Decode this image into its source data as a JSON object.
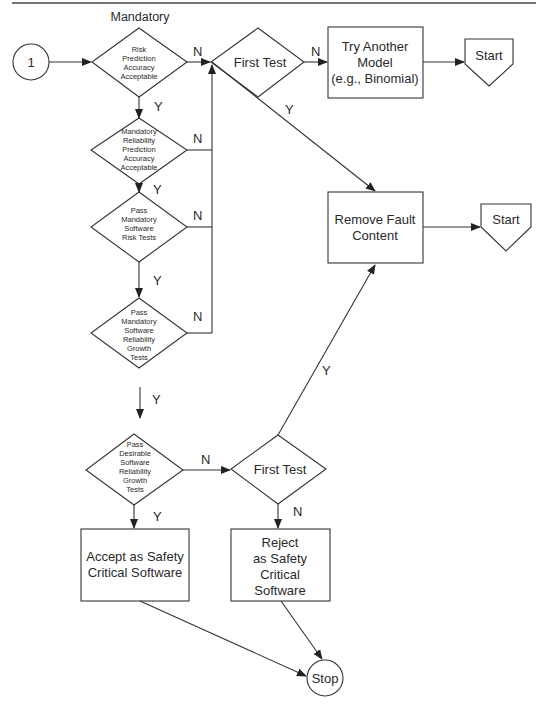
{
  "page": {
    "top_rule": true,
    "section_label": "Mandatory"
  },
  "nodes": {
    "connector_1": {
      "label": "1"
    },
    "risk_prediction": {
      "lines": [
        "Risk",
        "Prediction",
        "Accuracy",
        "Acceptable"
      ]
    },
    "first_test_top": {
      "label": "First Test"
    },
    "try_another_model": {
      "lines": [
        "Try Another",
        "Model",
        "(e.g., Binomial)"
      ]
    },
    "start_top": {
      "label": "Start"
    },
    "mandatory_reliability": {
      "lines": [
        "Mandatory",
        "Reliability",
        "Prediction",
        "Accuracy",
        "Acceptable"
      ]
    },
    "pass_mandatory_risk": {
      "lines": [
        "Pass",
        "Mandatory",
        "Software",
        "Risk Tests"
      ]
    },
    "remove_fault_content": {
      "lines": [
        "Remove Fault",
        "Content"
      ]
    },
    "start_mid": {
      "label": "Start"
    },
    "pass_mandatory_growth": {
      "lines": [
        "Pass",
        "Mandatory",
        "Software",
        "Reliability",
        "Growth",
        "Tests"
      ]
    },
    "pass_desirable_growth": {
      "lines": [
        "Pass",
        "Desirable",
        "Software",
        "Reliability",
        "Growth",
        "Tests"
      ]
    },
    "first_test_bottom": {
      "label": "First Test"
    },
    "accept": {
      "lines": [
        "Accept as Safety",
        "Critical Software"
      ]
    },
    "reject": {
      "lines": [
        "Reject",
        "as Safety",
        "Critical",
        "Software"
      ]
    },
    "stop": {
      "label": "Stop"
    }
  },
  "edge_labels": {
    "risk_no": "N",
    "risk_yes": "Y",
    "first_test_top_no": "N",
    "first_test_top_yes": "Y",
    "reliability_no": "N",
    "reliability_yes": "Y",
    "risk_tests_no": "N",
    "risk_tests_yes": "Y",
    "mandatory_growth_no": "N",
    "mandatory_growth_yes": "Y",
    "desirable_no": "N",
    "desirable_yes": "Y",
    "first_test_bottom_no": "N",
    "first_test_bottom_yes": "Y"
  },
  "colors": {
    "stroke": "#333333",
    "fill": "#ffffff",
    "text": "#2a2a2a"
  }
}
